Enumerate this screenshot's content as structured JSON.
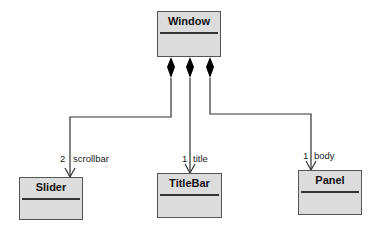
{
  "diagram": {
    "type": "UML class diagram - composition",
    "classes": [
      {
        "id": "window",
        "name": "Window"
      },
      {
        "id": "slider",
        "name": "Slider"
      },
      {
        "id": "titlebar",
        "name": "TitleBar"
      },
      {
        "id": "panel",
        "name": "Panel"
      }
    ],
    "associations": [
      {
        "from": "Window",
        "to": "Slider",
        "kind": "composition",
        "multiplicity": "2",
        "role": "scrollbar"
      },
      {
        "from": "Window",
        "to": "TitleBar",
        "kind": "composition",
        "multiplicity": "1",
        "role": "title"
      },
      {
        "from": "Window",
        "to": "Panel",
        "kind": "composition",
        "multiplicity": "1",
        "role": "body"
      }
    ]
  },
  "colors": {
    "box_fill": "#dcdcdc",
    "box_border": "#555555",
    "line": "#333333",
    "diamond": "#000000"
  }
}
